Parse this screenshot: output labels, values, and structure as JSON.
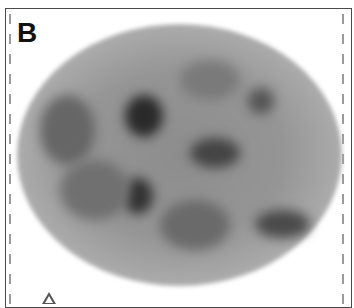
{
  "figure": {
    "panel_label": "B",
    "image_type": "grayscale axial scan",
    "colors": {
      "border": "#4a4a4a",
      "dashes": "#9a9a9a",
      "background": "#ffffff",
      "dense_region": "#2a2a2a"
    },
    "annotations": [
      {
        "type": "arrow",
        "direction": "up"
      }
    ]
  }
}
